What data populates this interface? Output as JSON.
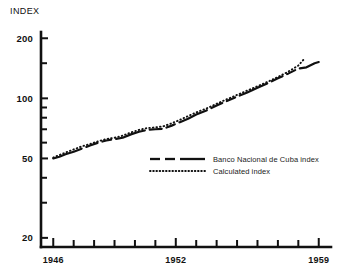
{
  "chart_data": {
    "type": "line",
    "title": "",
    "ylabel": "INDEX",
    "xlabel": "",
    "yscale": "log",
    "ylim": [
      18,
      215
    ],
    "xlim": [
      1945.4,
      1959.6
    ],
    "grid": false,
    "legend_position": "center",
    "ytick_labels": [
      "200",
      "100",
      "50",
      "20"
    ],
    "ytick_values": [
      200,
      100,
      50,
      20
    ],
    "yminor_values": [
      150,
      90,
      80,
      70,
      60,
      40,
      30
    ],
    "xtick_labels": [
      "1946",
      "1952",
      "1959"
    ],
    "xtick_values": [
      1946,
      1952,
      1959
    ],
    "xminor_values": [
      1947,
      1948,
      1949,
      1950,
      1951,
      1953,
      1954,
      1955,
      1956,
      1957,
      1958
    ],
    "series": [
      {
        "name": "Banco Nacional de Cuba index",
        "style": "dashed-solid",
        "x": [
          1946.0,
          1946.3,
          1946.6,
          1947.0,
          1947.4,
          1947.8,
          1948.2,
          1948.6,
          1949.0,
          1949.4,
          1949.8,
          1950.2,
          1950.6,
          1951.0,
          1951.4,
          1951.8,
          1952.2,
          1952.6,
          1953.0,
          1953.5,
          1954.0,
          1954.5,
          1955.0,
          1955.5,
          1956.0,
          1956.5,
          1957.0,
          1957.5,
          1958.0,
          1958.4,
          1958.8,
          1959.0
        ],
        "y": [
          50.0,
          51.0,
          52.5,
          54.0,
          56.0,
          58.0,
          60.0,
          61.5,
          62.5,
          63.5,
          66.0,
          68.0,
          69.5,
          70.0,
          70.5,
          73.0,
          76.0,
          79.0,
          83.0,
          87.0,
          92.0,
          97.0,
          102.0,
          107.0,
          113.0,
          119.0,
          126.0,
          133.0,
          141.0,
          143.0,
          150.0,
          152.0
        ]
      },
      {
        "name": "Calculated index",
        "style": "dotted",
        "x": [
          1946.0,
          1946.3,
          1946.6,
          1947.0,
          1947.4,
          1947.8,
          1948.2,
          1948.6,
          1949.0,
          1949.4,
          1949.8,
          1950.2,
          1950.6,
          1951.0,
          1951.4,
          1951.8,
          1952.2,
          1952.6,
          1953.0,
          1953.5,
          1954.0,
          1954.5,
          1955.0,
          1955.5,
          1956.0,
          1956.5,
          1957.0,
          1957.5,
          1958.0,
          1958.3
        ],
        "y": [
          50.5,
          52.0,
          53.5,
          55.5,
          57.5,
          59.0,
          61.0,
          62.5,
          63.5,
          65.0,
          67.5,
          69.5,
          71.0,
          71.5,
          72.5,
          75.0,
          78.0,
          81.5,
          85.0,
          89.0,
          94.0,
          99.0,
          104.0,
          109.5,
          115.0,
          121.0,
          128.0,
          136.0,
          146.0,
          158.0
        ]
      }
    ],
    "legend": [
      {
        "label": "Banco Nacional de Cuba index",
        "style": "dashed-solid"
      },
      {
        "label": "Calculated index",
        "style": "dotted"
      }
    ]
  }
}
